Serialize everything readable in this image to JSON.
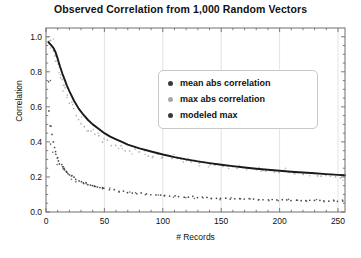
{
  "chart_data": {
    "type": "scatter",
    "title": "Observed Correlation from 1,000 Random Vectors",
    "xlabel": "# Records",
    "ylabel": "Correlation",
    "xlim": [
      0,
      256
    ],
    "ylim": [
      0.0,
      1.05
    ],
    "xticks": [
      0,
      50,
      100,
      150,
      200,
      250
    ],
    "xticklabels": [
      "0",
      "50",
      "100",
      "150",
      "200",
      "250"
    ],
    "yticks": [
      0.0,
      0.2,
      0.4,
      0.6,
      0.8,
      1.0
    ],
    "yticklabels": [
      "0.0",
      "0.2",
      "0.4",
      "0.6",
      "0.8",
      "1.0"
    ],
    "grid": "vertical-major-faint",
    "legend_position": "upper-center-right",
    "colors": {
      "mean_abs_correlation": "#3a3a3a",
      "max_abs_correlation": "#a8a8a8",
      "modeled_max": "#1a1a1a",
      "axis": "#6e6e6e",
      "grid": "#dcdcdc",
      "background": "#ffffff"
    },
    "series": [
      {
        "name": "mean abs correlation",
        "type": "scatter",
        "marker": "dot",
        "color": "#3a3a3a",
        "x": [
          2,
          3,
          4,
          5,
          6,
          7,
          8,
          9,
          10,
          11,
          12,
          13,
          14,
          15,
          16,
          17,
          18,
          19,
          20,
          22,
          24,
          26,
          28,
          30,
          32,
          34,
          36,
          38,
          40,
          42,
          44,
          46,
          48,
          50,
          54,
          58,
          62,
          66,
          70,
          74,
          78,
          82,
          86,
          90,
          94,
          98,
          102,
          106,
          110,
          114,
          118,
          122,
          126,
          130,
          134,
          138,
          142,
          146,
          150,
          154,
          158,
          162,
          166,
          170,
          174,
          178,
          182,
          186,
          190,
          194,
          198,
          202,
          206,
          210,
          214,
          218,
          222,
          226,
          230,
          234,
          238,
          242,
          246,
          250,
          254
        ],
        "y": [
          0.74,
          0.58,
          0.49,
          0.44,
          0.4,
          0.37,
          0.345,
          0.325,
          0.305,
          0.29,
          0.278,
          0.266,
          0.256,
          0.247,
          0.239,
          0.232,
          0.225,
          0.219,
          0.213,
          0.203,
          0.195,
          0.187,
          0.18,
          0.174,
          0.169,
          0.164,
          0.159,
          0.155,
          0.151,
          0.147,
          0.144,
          0.141,
          0.138,
          0.135,
          0.13,
          0.125,
          0.121,
          0.118,
          0.114,
          0.111,
          0.108,
          0.106,
          0.103,
          0.101,
          0.099,
          0.097,
          0.095,
          0.093,
          0.091,
          0.09,
          0.088,
          0.087,
          0.086,
          0.084,
          0.083,
          0.082,
          0.081,
          0.08,
          0.079,
          0.078,
          0.077,
          0.076,
          0.075,
          0.074,
          0.074,
          0.073,
          0.072,
          0.071,
          0.071,
          0.07,
          0.07,
          0.069,
          0.069,
          0.068,
          0.068,
          0.067,
          0.067,
          0.066,
          0.066,
          0.065,
          0.065,
          0.064,
          0.064,
          0.063,
          0.063
        ]
      },
      {
        "name": "max abs correlation",
        "type": "scatter",
        "marker": "dot",
        "color": "#a8a8a8",
        "x": [
          2,
          3,
          4,
          5,
          6,
          7,
          8,
          9,
          10,
          11,
          12,
          13,
          14,
          15,
          16,
          18,
          20,
          22,
          24,
          26,
          28,
          30,
          33,
          36,
          39,
          42,
          45,
          48,
          52,
          56,
          60,
          64,
          68,
          72,
          76,
          80,
          84,
          88,
          92,
          96,
          100,
          104,
          108,
          112,
          116,
          120,
          124,
          128,
          132,
          136,
          140,
          144,
          148,
          152,
          156,
          160,
          164,
          168,
          172,
          176,
          180,
          184,
          188,
          192,
          196,
          200,
          204,
          208,
          212,
          216,
          220,
          224,
          228,
          232,
          236,
          240,
          244,
          248,
          252,
          255
        ],
        "y": [
          1.0,
          0.99,
          0.97,
          0.95,
          0.93,
          0.91,
          0.88,
          0.86,
          0.84,
          0.82,
          0.79,
          0.77,
          0.75,
          0.72,
          0.7,
          0.66,
          0.63,
          0.62,
          0.58,
          0.55,
          0.53,
          0.5,
          0.49,
          0.47,
          0.46,
          0.44,
          0.43,
          0.41,
          0.4,
          0.39,
          0.385,
          0.37,
          0.36,
          0.355,
          0.35,
          0.345,
          0.34,
          0.33,
          0.325,
          0.32,
          0.315,
          0.315,
          0.31,
          0.3,
          0.3,
          0.295,
          0.29,
          0.285,
          0.285,
          0.28,
          0.275,
          0.27,
          0.27,
          0.265,
          0.26,
          0.26,
          0.255,
          0.25,
          0.25,
          0.245,
          0.245,
          0.24,
          0.24,
          0.235,
          0.235,
          0.23,
          0.23,
          0.225,
          0.225,
          0.22,
          0.22,
          0.215,
          0.215,
          0.21,
          0.21,
          0.205,
          0.205,
          0.2,
          0.2,
          0.2
        ]
      },
      {
        "name": "modeled max",
        "type": "line",
        "color": "#1a1a1a",
        "x": [
          2,
          4,
          6,
          8,
          10,
          12,
          14,
          16,
          18,
          20,
          24,
          28,
          32,
          36,
          40,
          45,
          50,
          55,
          60,
          65,
          70,
          80,
          90,
          100,
          110,
          120,
          130,
          140,
          150,
          160,
          170,
          180,
          190,
          200,
          210,
          220,
          230,
          240,
          250,
          256
        ],
        "y": [
          0.97,
          0.955,
          0.94,
          0.915,
          0.875,
          0.83,
          0.79,
          0.755,
          0.72,
          0.69,
          0.635,
          0.59,
          0.555,
          0.525,
          0.5,
          0.475,
          0.45,
          0.43,
          0.415,
          0.4,
          0.385,
          0.363,
          0.345,
          0.328,
          0.313,
          0.3,
          0.289,
          0.279,
          0.27,
          0.262,
          0.254,
          0.247,
          0.241,
          0.235,
          0.23,
          0.225,
          0.221,
          0.216,
          0.212,
          0.21
        ]
      }
    ]
  },
  "legend": {
    "items": [
      {
        "label": "mean abs correlation",
        "color": "#3a3a3a"
      },
      {
        "label": "max abs correlation",
        "color": "#a8a8a8"
      },
      {
        "label": "modeled max",
        "color": "#3a3a3a"
      }
    ]
  }
}
